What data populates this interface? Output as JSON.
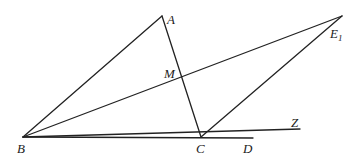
{
  "diagram": {
    "type": "geometry",
    "points": {
      "B": {
        "label": "B",
        "x": 23,
        "y": 137
      },
      "A": {
        "label": "A",
        "x": 162,
        "y": 16
      },
      "M": {
        "label": "M",
        "x": 179,
        "y": 77
      },
      "E1": {
        "label": "E",
        "subscript": "1",
        "x": 342,
        "y": 16
      },
      "C": {
        "label": "C",
        "x": 201,
        "y": 137
      },
      "D": {
        "label": "D",
        "x": 253,
        "y": 138
      },
      "Z": {
        "label": "Z",
        "x": 300,
        "y": 129
      }
    },
    "segments": [
      {
        "from": "B",
        "to": "A"
      },
      {
        "from": "A",
        "to": "C"
      },
      {
        "from": "B",
        "to": "E1"
      },
      {
        "from": "E1",
        "to": "C"
      },
      {
        "from": "B",
        "to": "D"
      },
      {
        "from": "B",
        "to": "Z"
      }
    ],
    "labels": {
      "A": "A",
      "M": "M",
      "E": "E",
      "E_sub": "1",
      "B": "B",
      "C": "C",
      "D": "D",
      "Z": "Z"
    }
  }
}
